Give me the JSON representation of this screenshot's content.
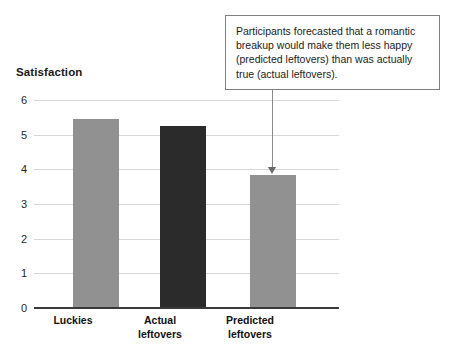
{
  "chart_data": {
    "type": "bar",
    "title": "",
    "subtitle": "",
    "xlabel": "",
    "ylabel": "Satisfaction",
    "ylim": [
      0,
      6
    ],
    "ytick_labels": [
      "0",
      "1",
      "2",
      "3",
      "4",
      "5",
      "6"
    ],
    "ytick_values": [
      0,
      1,
      2,
      3,
      4,
      5,
      6
    ],
    "grid": true,
    "legend": "none",
    "categories": [
      "Luckies",
      "Actual leftovers",
      "Predicted leftovers"
    ],
    "category_lines": [
      [
        "Luckies"
      ],
      [
        "Actual",
        "leftovers"
      ],
      [
        "Predicted",
        "leftovers"
      ]
    ],
    "values": [
      5.45,
      5.25,
      3.85
    ],
    "bar_colors": [
      "#919191",
      "#2b2b2b",
      "#919191"
    ],
    "annotations": [
      {
        "text": "Participants forecasted that a romantic breakup would make them less happy (predicted leftovers) than was actually true (actual leftovers).",
        "points_to": "Predicted leftovers"
      }
    ]
  },
  "colors": {
    "bar_light": "#919191",
    "bar_dark": "#2b2b2b",
    "gridline": "#d6d6d6",
    "axis": "#3a3a3a",
    "callout_border": "#808080",
    "leader": "#8a8a8a",
    "text": "#1a1a1a",
    "background": "#ffffff"
  }
}
